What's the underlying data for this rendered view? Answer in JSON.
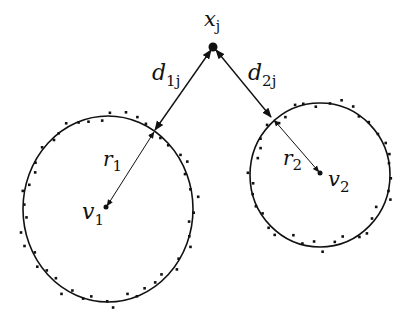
{
  "diagram": {
    "type": "cluster-distance-illustration",
    "point": {
      "label": "x",
      "sub": "j",
      "cx": 213,
      "cy": 47
    },
    "clusters": [
      {
        "name": "cluster-1",
        "center": {
          "label": "v",
          "sub": "1",
          "cx": 108,
          "cy": 209
        },
        "rx": 85,
        "ry": 93,
        "radius_label": {
          "label": "r",
          "sub": "1"
        },
        "distance_label": {
          "label": "d",
          "sub": "1j"
        },
        "intersection": {
          "x": 154,
          "y": 132
        }
      },
      {
        "name": "cluster-2",
        "center": {
          "label": "v",
          "sub": "2",
          "cx": 320,
          "cy": 174
        },
        "rx": 70,
        "ry": 72,
        "radius_label": {
          "label": "r",
          "sub": "2"
        },
        "distance_label": {
          "label": "d",
          "sub": "2j"
        },
        "intersection": {
          "x": 273,
          "y": 119
        }
      }
    ],
    "colors": {
      "stroke": "#111111",
      "background": "#ffffff"
    }
  }
}
